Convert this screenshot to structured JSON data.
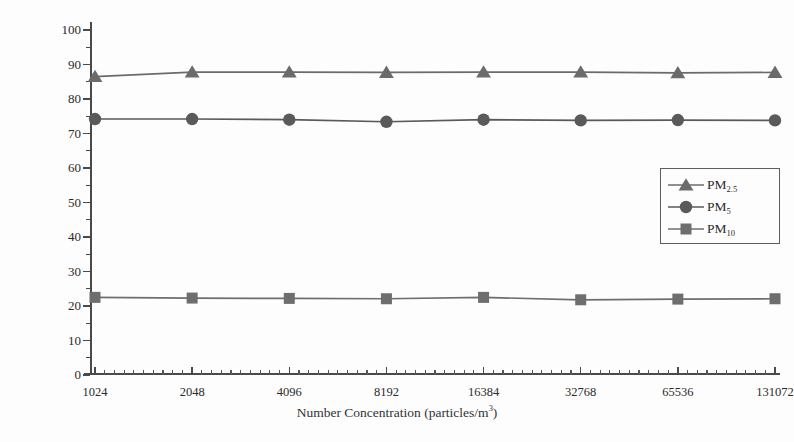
{
  "chart_data": {
    "type": "line",
    "title": "",
    "xlabel": "Number Concentration (particles/m",
    "xlabel_sup": "3",
    "xlabel_tail": ")",
    "ylabel": "Sampling Efficiency(%)",
    "categories": [
      "1024",
      "2048",
      "4096",
      "8192",
      "16384",
      "32768",
      "65536",
      "131072"
    ],
    "ylim": [
      0,
      100
    ],
    "ytick_labels": [
      "0",
      "10",
      "20",
      "30",
      "40",
      "50",
      "60",
      "70",
      "80",
      "90",
      "100"
    ],
    "ytick_values": [
      0,
      10,
      20,
      30,
      40,
      50,
      60,
      70,
      80,
      90,
      100
    ],
    "yminor_values": [
      5,
      15,
      25,
      35,
      45,
      55,
      65,
      75,
      85,
      95
    ],
    "grid": false,
    "legend_position": "center-right",
    "series": [
      {
        "name": "PM2.5",
        "label_base": "PM",
        "label_sub": "2.5",
        "marker": "triangle",
        "color": "#6b6b6b",
        "values": [
          86.5,
          87.8,
          87.8,
          87.7,
          87.8,
          87.8,
          87.6,
          87.7
        ]
      },
      {
        "name": "PM5",
        "label_base": "PM",
        "label_sub": "5",
        "marker": "circle",
        "color": "#5a5a5a",
        "values": [
          74.2,
          74.2,
          74.0,
          73.4,
          74.0,
          73.8,
          73.9,
          73.8
        ]
      },
      {
        "name": "PM10",
        "label_base": "PM",
        "label_sub": "10",
        "marker": "square",
        "color": "#6e6e6e",
        "values": [
          22.5,
          22.3,
          22.2,
          22.1,
          22.5,
          21.8,
          22.0,
          22.1
        ]
      }
    ],
    "xminor_per_interval": 9,
    "colors": {
      "axis": "#4a4a4a",
      "background": "#fdfdfd",
      "text": "#2b2b2b"
    }
  }
}
